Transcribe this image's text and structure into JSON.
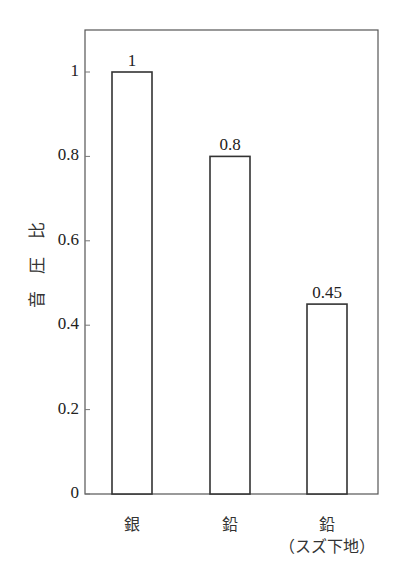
{
  "chart_data": {
    "type": "bar",
    "title": "",
    "xlabel": "",
    "ylabel": "音 圧 比",
    "categories": [
      "銀",
      "鉛",
      "鉛（スズ下地）"
    ],
    "category_lines": [
      [
        "銀"
      ],
      [
        "鉛"
      ],
      [
        "鉛",
        "（スズ下地）"
      ]
    ],
    "values": [
      1,
      0.8,
      0.45
    ],
    "value_labels": [
      "1",
      "0.8",
      "0.45"
    ],
    "ylim": [
      0,
      1.1
    ],
    "yticks": [
      0,
      0.2,
      0.4,
      0.6,
      0.8,
      1
    ],
    "ytick_labels": [
      "0",
      "0.2",
      "0.4",
      "0.6",
      "0.8",
      "1"
    ],
    "grid": false,
    "legend": null,
    "bar_fill": "#ffffff",
    "bar_stroke": "#333333",
    "frame_stroke": "#555555"
  }
}
